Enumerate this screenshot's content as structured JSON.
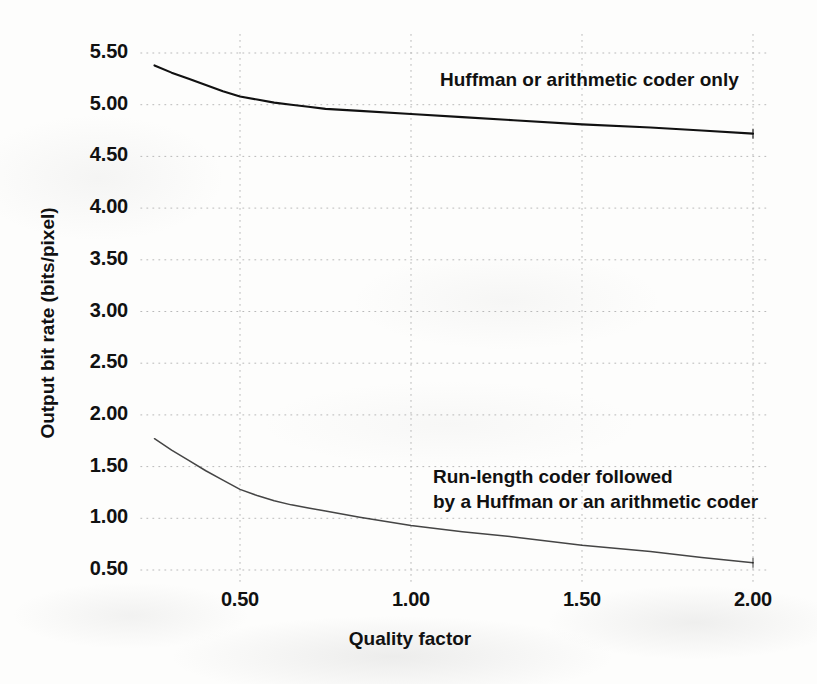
{
  "chart_data": {
    "type": "line",
    "title": "",
    "xlabel": "Quality factor",
    "ylabel": "Output bit rate (bits/pixel)",
    "xlim": [
      0.21,
      2.04
    ],
    "ylim": [
      0.38,
      5.68
    ],
    "xticks": [
      "0.50",
      "1.00",
      "1.50",
      "2.00"
    ],
    "xtick_values": [
      0.5,
      1.0,
      1.5,
      2.0
    ],
    "yticks": [
      "0.50",
      "1.00",
      "1.50",
      "2.00",
      "2.50",
      "3.00",
      "3.50",
      "4.00",
      "4.50",
      "5.00",
      "5.50"
    ],
    "ytick_values": [
      0.5,
      1.0,
      1.5,
      2.0,
      2.5,
      3.0,
      3.5,
      4.0,
      4.5,
      5.0,
      5.5
    ],
    "grid": "dotted",
    "legend": "inline-annotations",
    "series": [
      {
        "name": "Huffman or arithmetic coder only",
        "annotation": "Huffman or arithmetic coder only",
        "x": [
          0.25,
          0.3,
          0.35,
          0.4,
          0.45,
          0.5,
          0.55,
          0.6,
          0.65,
          0.7,
          0.75,
          0.85,
          1.0,
          1.15,
          1.3,
          1.5,
          1.7,
          1.85,
          2.0
        ],
        "y": [
          5.38,
          5.31,
          5.25,
          5.19,
          5.13,
          5.08,
          5.05,
          5.02,
          5.0,
          4.98,
          4.96,
          4.94,
          4.91,
          4.88,
          4.85,
          4.81,
          4.78,
          4.75,
          4.72
        ]
      },
      {
        "name": "Run-length coder followed by a Huffman or an arithmetic coder",
        "annotation": "Run-length coder followed\nby a Huffman or an arithmetic coder",
        "x": [
          0.25,
          0.3,
          0.35,
          0.4,
          0.45,
          0.5,
          0.55,
          0.6,
          0.65,
          0.7,
          0.75,
          0.85,
          1.0,
          1.15,
          1.3,
          1.5,
          1.7,
          1.85,
          2.0
        ],
        "y": [
          1.77,
          1.66,
          1.56,
          1.46,
          1.37,
          1.28,
          1.22,
          1.17,
          1.13,
          1.1,
          1.07,
          1.01,
          0.93,
          0.87,
          0.82,
          0.74,
          0.68,
          0.62,
          0.57
        ]
      }
    ]
  },
  "colors": {
    "background": "#fdfdfc",
    "line": "#111111",
    "grid": "#b9b9b9",
    "text": "#111111"
  }
}
